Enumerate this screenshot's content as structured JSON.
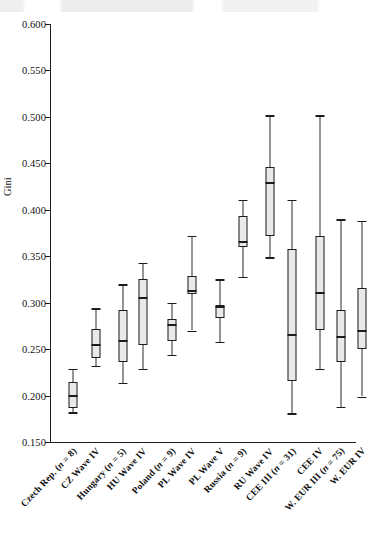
{
  "axis": {
    "y_title": "Gini",
    "y_ticks": [
      "0.600",
      "0.550",
      "0.500",
      "0.450",
      "0.400",
      "0.350",
      "0.300",
      "0.250",
      "0.200",
      "0.150"
    ]
  },
  "chart_data": {
    "type": "box",
    "title": "",
    "xlabel": "",
    "ylabel": "Gini",
    "ylim": [
      0.15,
      0.6
    ],
    "ytick_values": [
      0.6,
      0.55,
      0.5,
      0.45,
      0.4,
      0.35,
      0.3,
      0.25,
      0.2,
      0.15
    ],
    "ytick_labels": [
      "0.600",
      "0.550",
      "0.500",
      "0.450",
      "0.400",
      "0.350",
      "0.300",
      "0.250",
      "0.200",
      "0.150"
    ],
    "grid": false,
    "legend": "none",
    "categories": [
      "Czech Rep. (n = 8)",
      "CZ Wave IV",
      "Hungary (n = 5)",
      "HU Wave IV",
      "Poland (n = 9)",
      "PL Wave IV",
      "PL Wave V",
      "Russia (n = 9)",
      "RU Wave IV",
      "CEE III (n = 31)",
      "CEE IV",
      "W. EUR III (n = 75)",
      "W. EUR IV"
    ],
    "boxes": [
      {
        "label": "Czech Rep. (n = 8)",
        "whisker_low": 0.182,
        "q1": 0.186,
        "median": 0.2,
        "q3": 0.215,
        "whisker_high": 0.229
      },
      {
        "label": "CZ Wave IV",
        "whisker_low": 0.232,
        "q1": 0.24,
        "median": 0.254,
        "q3": 0.272,
        "whisker_high": 0.294
      },
      {
        "label": "Hungary (n = 5)",
        "whisker_low": 0.214,
        "q1": 0.236,
        "median": 0.259,
        "q3": 0.292,
        "whisker_high": 0.32
      },
      {
        "label": "HU Wave IV",
        "whisker_low": 0.229,
        "q1": 0.254,
        "median": 0.305,
        "q3": 0.326,
        "whisker_high": 0.343
      },
      {
        "label": "Poland (n = 9)",
        "whisker_low": 0.244,
        "q1": 0.259,
        "median": 0.276,
        "q3": 0.283,
        "whisker_high": 0.3
      },
      {
        "label": "PL Wave IV",
        "whisker_low": 0.27,
        "q1": 0.309,
        "median": 0.313,
        "q3": 0.329,
        "whisker_high": 0.372
      },
      {
        "label": "PL Wave V",
        "whisker_low": 0.258,
        "q1": 0.284,
        "median": 0.295,
        "q3": 0.298,
        "whisker_high": 0.325
      },
      {
        "label": "Russia (n = 9)",
        "whisker_low": 0.328,
        "q1": 0.36,
        "median": 0.365,
        "q3": 0.393,
        "whisker_high": 0.411
      },
      {
        "label": "RU Wave IV",
        "whisker_low": 0.349,
        "q1": 0.372,
        "median": 0.429,
        "q3": 0.446,
        "whisker_high": 0.502
      },
      {
        "label": "CEE III (n = 31)",
        "whisker_low": 0.181,
        "q1": 0.216,
        "median": 0.265,
        "q3": 0.358,
        "whisker_high": 0.411
      },
      {
        "label": "CEE IV",
        "whisker_low": 0.229,
        "q1": 0.27,
        "median": 0.31,
        "q3": 0.372,
        "whisker_high": 0.502
      },
      {
        "label": "W. EUR III (n = 75)",
        "whisker_low": 0.188,
        "q1": 0.236,
        "median": 0.263,
        "q3": 0.292,
        "whisker_high": 0.39
      },
      {
        "label": "W. EUR IV",
        "whisker_low": 0.199,
        "q1": 0.25,
        "median": 0.27,
        "q3": 0.316,
        "whisker_high": 0.388
      }
    ],
    "colors": {
      "box_fill": "#e9e9e9",
      "line": "#1c1c1c",
      "axis": "#1a1a1a"
    }
  }
}
